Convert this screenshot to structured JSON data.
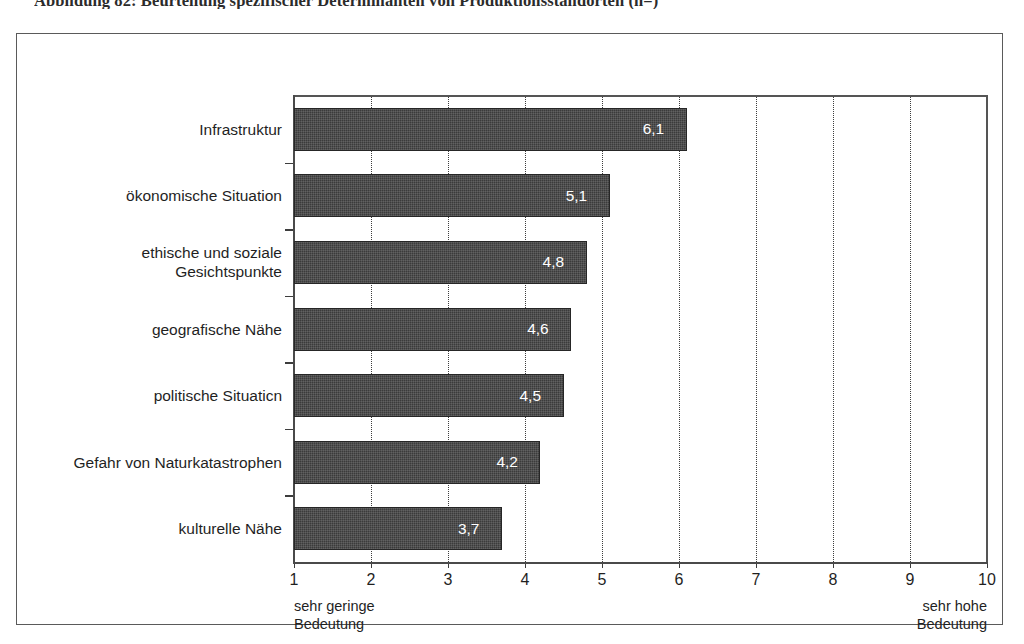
{
  "figure": {
    "caption": "Abbildung 82: Beurteilung spezifischer Determinanten von Produktionsstandorten (n=)"
  },
  "scale": {
    "low_line1": "sehr geringe",
    "low_line2": "Bedeutung",
    "high_line1": "sehr hohe",
    "high_line2": "Bedeutung"
  },
  "colors": {
    "bar": "#3b3b3b",
    "bar_border": "#262626",
    "value_text": "#ffffff",
    "axis": "#4a4a4a",
    "grid": "#3d3d3d",
    "frame": "#5a5a5a",
    "background": "#ffffff"
  },
  "chart_data": {
    "type": "bar",
    "orientation": "horizontal",
    "title": "Abbildung 82: Beurteilung spezifischer Determinanten von Produktionsstandorten (n=)",
    "xlabel": "",
    "ylabel": "",
    "xlim": [
      1,
      10
    ],
    "grid": true,
    "grid_axis": "x",
    "grid_style": "dotted",
    "legend": false,
    "value_label_format": "comma-decimal",
    "categories": [
      "Infrastruktur",
      "ökonomische Situation",
      "ethische und soziale Gesichtspunkte",
      "geografische Nähe",
      "politische Situaticn",
      "Gefahr von Naturkatastrophen",
      "kulturelle Nähe"
    ],
    "category_lines": [
      [
        "Infrastruktur"
      ],
      [
        "ökonomische Situation"
      ],
      [
        "ethische und soziale",
        "Gesichtspunkte"
      ],
      [
        "geografische Nähe"
      ],
      [
        "politische Situaticn"
      ],
      [
        "Gefahr von Naturkatastrophen"
      ],
      [
        "kulturelle Nähe"
      ]
    ],
    "values": [
      6.1,
      5.1,
      4.8,
      4.6,
      4.5,
      4.2,
      3.7
    ],
    "value_labels": [
      "6,1",
      "5,1",
      "4,8",
      "4,6",
      "4,5",
      "4,2",
      "3,7"
    ],
    "xticks": [
      1,
      2,
      3,
      4,
      5,
      6,
      7,
      8,
      9,
      10
    ],
    "xtick_labels": [
      "1",
      "2",
      "3",
      "4",
      "5",
      "6",
      "7",
      "8",
      "9",
      "10"
    ],
    "annotations": [
      {
        "position": "x-axis-left",
        "text": "sehr geringe Bedeutung"
      },
      {
        "position": "x-axis-right",
        "text": "sehr hohe Bedeutung"
      }
    ]
  }
}
